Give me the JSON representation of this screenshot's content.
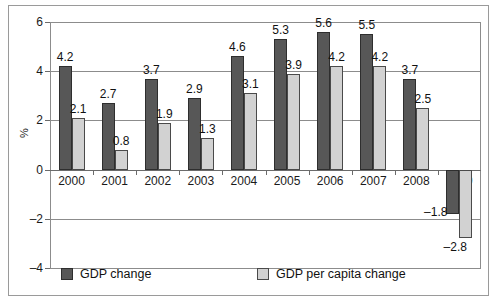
{
  "chart_data": {
    "type": "bar",
    "title": "",
    "subtitle": "",
    "xlabel": "",
    "ylabel": "%",
    "categories": [
      "2000",
      "2001",
      "2002",
      "2003",
      "2004",
      "2005",
      "2006",
      "2007",
      "2008",
      "2009"
    ],
    "series": [
      {
        "name": "GDP change",
        "color": "#575757",
        "values": [
          4.2,
          2.7,
          3.7,
          2.9,
          4.6,
          5.3,
          5.6,
          5.5,
          3.7,
          -1.8
        ],
        "labels": [
          "4.2",
          "2.7",
          "3.7",
          "2.9",
          "4.6",
          "5.3",
          "5.6",
          "5.5",
          "3.7",
          "–1.8"
        ]
      },
      {
        "name": "GDP per capita change",
        "color": "#d2d2d2",
        "values": [
          2.1,
          0.8,
          1.9,
          1.3,
          3.1,
          3.9,
          4.2,
          4.2,
          2.5,
          -2.8
        ],
        "labels": [
          "2.1",
          "0.8",
          "1.9",
          "1.3",
          "3.1",
          "3.9",
          "4.2",
          "4.2",
          "2.5",
          "–2.8"
        ]
      }
    ],
    "ylim": [
      -4,
      6
    ],
    "yticks": [
      6,
      4,
      2,
      0,
      -2,
      -4
    ],
    "ytick_labels": [
      "6",
      "4",
      "2",
      "0",
      "–2",
      "–4"
    ],
    "grid": true,
    "legend_position": "bottom"
  },
  "legend": {
    "entries": [
      {
        "label": "GDP change"
      },
      {
        "label": "GDP per capita change"
      }
    ]
  }
}
